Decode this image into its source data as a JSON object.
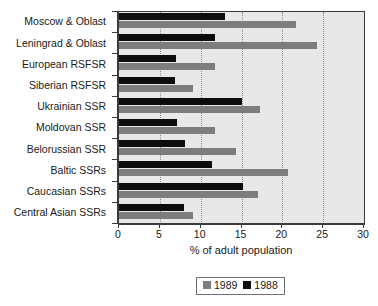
{
  "chart_data": {
    "type": "bar",
    "orientation": "horizontal",
    "title": "",
    "xlabel": "% of adult population",
    "ylabel": "",
    "xlim": [
      0,
      30
    ],
    "xticks": [
      0,
      5,
      10,
      15,
      20,
      25,
      30
    ],
    "xtick_labels": [
      "0",
      "5",
      "10",
      "15",
      "20",
      "25",
      "30"
    ],
    "grid": "vertical-dotted",
    "legend_position": "bottom-center",
    "categories": [
      "Moscow & Oblast",
      "Leningrad & Oblast",
      "European RSFSR",
      "Siberian RSFSR",
      "Ukrainian SSR",
      "Moldovan SSR",
      "Belorussian SSR",
      "Baltic SSRs",
      "Caucasian SSRs",
      "Central Asian SSRs"
    ],
    "series": [
      {
        "name": "1989",
        "color": "#7d7d7d",
        "values": [
          21.7,
          24.2,
          11.8,
          9.0,
          17.3,
          11.7,
          14.3,
          20.7,
          17.0,
          9.0
        ]
      },
      {
        "name": "1988",
        "color": "#0d0d0d",
        "values": [
          13.0,
          11.8,
          7.0,
          6.8,
          15.1,
          7.1,
          8.1,
          11.4,
          15.2,
          8.0
        ]
      }
    ]
  },
  "legend": {
    "entries": [
      {
        "label": "1989",
        "swatch": "gray-square-icon"
      },
      {
        "label": "1988",
        "swatch": "black-square-icon"
      }
    ]
  },
  "colors": {
    "series_1989": "#7d7d7d",
    "series_1988": "#0d0d0d",
    "plot_background": "#e8e8e8",
    "axis": "#3a3a3a",
    "gridline": "#8d8d8d",
    "text": "#1a1a1a"
  }
}
